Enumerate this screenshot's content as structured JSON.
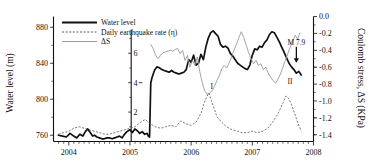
{
  "chart_data": {
    "type": "line",
    "title": "",
    "xlabel": "",
    "ylabel": "Water level (m)",
    "y2label": "Coulomb stress, ΔS (KPa)",
    "y3label": "Daily earthquake rate (η)",
    "xlim": [
      2003.75,
      2008.0
    ],
    "ylim": [
      753,
      892
    ],
    "y2lim": [
      -1.48,
      0.0
    ],
    "y3lim": [
      0,
      8.5
    ],
    "grid": false,
    "legend_position": "top-left-inside",
    "x_ticks": [
      "2004",
      "2005",
      "2006",
      "2007",
      "2008"
    ],
    "x_tick_values": [
      2004,
      2005,
      2006,
      2007,
      2008
    ],
    "y_ticks": [
      "760",
      "800",
      "840",
      "880"
    ],
    "y_tick_values": [
      760,
      800,
      840,
      880
    ],
    "y2_ticks": [
      "0.0",
      "-0.2",
      "-0.4",
      "-0.6",
      "-0.8",
      "-1.0",
      "-1.2",
      "-1.4"
    ],
    "y2_tick_values": [
      0.0,
      -0.2,
      -0.4,
      -0.6,
      -0.8,
      -1.0,
      -1.2,
      -1.4
    ],
    "y3_ticks": [
      "2",
      "4",
      "6"
    ],
    "y3_tick_values": [
      2,
      4,
      6
    ],
    "minor_ticks_per_year": 12,
    "legend": [
      {
        "label": "Water level",
        "style": "solid-thick-black",
        "color": "#111111"
      },
      {
        "label": "Daily earthquake rate (η)",
        "style": "dashed-gray",
        "color": "#4d4d4d"
      },
      {
        "label": "ΔS",
        "style": "solid-thin-gray",
        "color": "#9a9a9a"
      }
    ],
    "annotations": [
      {
        "text": "M 7.9",
        "kind": "event-arrow",
        "x": 2007.72,
        "y_axis": "left",
        "y": 845
      },
      {
        "text": "I",
        "kind": "peak-label",
        "x": 2006.29,
        "y_axis": "eq",
        "y": 3.6
      },
      {
        "text": "II",
        "kind": "peak-label",
        "x": 2007.55,
        "y_axis": "eq",
        "y": 3.9
      }
    ],
    "series": [
      {
        "name": "Water level",
        "axis": "left",
        "units": "m",
        "x": [
          2003.83,
          2003.9,
          2003.96,
          2004.02,
          2004.08,
          2004.13,
          2004.18,
          2004.23,
          2004.27,
          2004.31,
          2004.35,
          2004.39,
          2004.42,
          2004.46,
          2004.5,
          2004.54,
          2004.58,
          2004.62,
          2004.66,
          2004.71,
          2004.75,
          2004.79,
          2004.83,
          2004.87,
          2004.91,
          2004.95,
          2005.0,
          2005.04,
          2005.08,
          2005.12,
          2005.16,
          2005.2,
          2005.24,
          2005.28,
          2005.3,
          2005.32,
          2005.34,
          2005.36,
          2005.4,
          2005.44,
          2005.48,
          2005.52,
          2005.56,
          2005.6,
          2005.64,
          2005.68,
          2005.72,
          2005.76,
          2005.8,
          2005.84,
          2005.88,
          2005.92,
          2005.96,
          2006.0,
          2006.04,
          2006.08,
          2006.12,
          2006.16,
          2006.2,
          2006.24,
          2006.28,
          2006.32,
          2006.36,
          2006.4,
          2006.44,
          2006.48,
          2006.52,
          2006.56,
          2006.6,
          2006.64,
          2006.68,
          2006.72,
          2006.76,
          2006.8,
          2006.84,
          2006.88,
          2006.92,
          2006.96,
          2007.0,
          2007.04,
          2007.08,
          2007.12,
          2007.16,
          2007.2,
          2007.24,
          2007.28,
          2007.32,
          2007.36,
          2007.4,
          2007.44,
          2007.48,
          2007.52,
          2007.56,
          2007.6,
          2007.64,
          2007.68,
          2007.72,
          2007.76,
          2007.8
        ],
        "y": [
          760,
          759,
          758,
          762,
          759,
          757,
          761,
          759,
          764,
          767,
          763,
          759,
          760,
          758,
          757,
          756,
          756,
          757,
          757,
          756,
          757,
          758,
          759,
          757,
          761,
          764,
          766,
          763,
          767,
          765,
          762,
          764,
          761,
          762,
          759,
          758,
          818,
          824,
          832,
          836,
          835,
          833,
          832,
          831,
          830,
          832,
          830,
          829,
          828,
          829,
          830,
          833,
          844,
          841,
          849,
          838,
          840,
          850,
          844,
          858,
          868,
          874,
          876,
          873,
          870,
          861,
          858,
          859,
          857,
          851,
          848,
          844,
          840,
          838,
          836,
          834,
          833,
          838,
          849,
          856,
          855,
          859,
          858,
          863,
          866,
          872,
          875,
          874,
          869,
          864,
          858,
          852,
          846,
          840,
          836,
          833,
          829,
          831,
          827
        ]
      },
      {
        "name": "ΔS",
        "axis": "right",
        "units": "KPa",
        "x": [
          2005.34,
          2005.38,
          2005.42,
          2005.46,
          2005.5,
          2005.54,
          2005.58,
          2005.62,
          2005.66,
          2005.7,
          2005.74,
          2005.78,
          2005.82,
          2005.86,
          2005.9,
          2005.94,
          2005.98,
          2006.02,
          2006.06,
          2006.1,
          2006.14,
          2006.18,
          2006.22,
          2006.26,
          2006.3,
          2006.34,
          2006.38,
          2006.42,
          2006.46,
          2006.5,
          2006.54,
          2006.58,
          2006.62,
          2006.66,
          2006.7,
          2006.74,
          2006.78,
          2006.82,
          2006.86,
          2006.9,
          2006.94,
          2006.98,
          2007.02,
          2007.06,
          2007.1,
          2007.14,
          2007.18,
          2007.22,
          2007.26,
          2007.3,
          2007.34,
          2007.38,
          2007.42,
          2007.46,
          2007.5,
          2007.54,
          2007.58,
          2007.62,
          2007.66,
          2007.7,
          2007.74,
          2007.78
        ],
        "y": [
          -0.33,
          -0.38,
          -0.46,
          -0.5,
          -0.46,
          -0.43,
          -0.42,
          -0.41,
          -0.4,
          -0.41,
          -0.39,
          -0.38,
          -0.44,
          -0.4,
          -0.52,
          -0.46,
          -0.6,
          -0.52,
          -0.58,
          -0.48,
          -0.65,
          -0.78,
          -0.88,
          -0.92,
          -0.91,
          -0.88,
          -0.83,
          -0.76,
          -0.7,
          -0.62,
          -0.58,
          -0.61,
          -0.55,
          -0.48,
          -0.4,
          -0.33,
          -0.25,
          -0.18,
          -0.25,
          -0.34,
          -0.43,
          -0.5,
          -0.56,
          -0.52,
          -0.58,
          -0.56,
          -0.63,
          -0.6,
          -0.67,
          -0.72,
          -0.76,
          -0.79,
          -0.74,
          -0.68,
          -0.6,
          -0.52,
          -0.44,
          -0.36,
          -0.3,
          -0.22,
          -0.27,
          -0.19
        ]
      },
      {
        "name": "Daily earthquake rate (η)",
        "axis": "eq",
        "units": "events/day",
        "x": [
          2003.83,
          2003.92,
          2004.0,
          2004.08,
          2004.17,
          2004.25,
          2004.33,
          2004.42,
          2004.5,
          2004.58,
          2004.67,
          2004.75,
          2004.83,
          2004.92,
          2005.0,
          2005.08,
          2005.17,
          2005.25,
          2005.33,
          2005.42,
          2005.5,
          2005.58,
          2005.67,
          2005.75,
          2005.83,
          2005.92,
          2006.0,
          2006.08,
          2006.17,
          2006.21,
          2006.25,
          2006.29,
          2006.33,
          2006.38,
          2006.42,
          2006.5,
          2006.58,
          2006.67,
          2006.75,
          2006.83,
          2006.92,
          2007.0,
          2007.08,
          2007.17,
          2007.25,
          2007.33,
          2007.42,
          2007.5,
          2007.55,
          2007.6,
          2007.65,
          2007.7,
          2007.75,
          2007.8
        ],
        "y": [
          0.5,
          0.6,
          0.7,
          0.9,
          1.0,
          0.9,
          0.8,
          0.7,
          0.6,
          0.5,
          0.5,
          0.6,
          0.7,
          0.8,
          0.9,
          1.0,
          1.3,
          1.5,
          1.2,
          1.0,
          0.9,
          1.0,
          1.1,
          1.0,
          1.4,
          1.2,
          1.1,
          1.3,
          2.0,
          2.6,
          3.0,
          3.3,
          2.8,
          2.2,
          1.7,
          1.3,
          1.0,
          0.8,
          0.7,
          0.6,
          0.6,
          0.7,
          0.6,
          0.7,
          0.9,
          1.3,
          1.9,
          2.6,
          3.1,
          2.9,
          2.4,
          1.8,
          1.2,
          0.7
        ]
      }
    ]
  }
}
